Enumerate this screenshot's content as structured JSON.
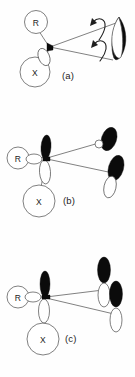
{
  "figure": {
    "background_color": "#ffffff",
    "ink_color": "#1a1a1a",
    "lobe_filled_color": "#0b0b0b",
    "lobe_empty_color": "#ffffff"
  },
  "panels": [
    {
      "id": "a",
      "label": "(a)",
      "substituents": [
        {
          "symbol": "R",
          "position": "upper-left"
        },
        {
          "symbol": "X",
          "position": "lower-left"
        }
      ],
      "orbital_count": 1,
      "orbital_style": "filled-leaf",
      "rotation_arrows": 2,
      "bond_lines": 2
    },
    {
      "id": "b",
      "label": "(b)",
      "substituents": [
        {
          "symbol": "R",
          "position": "left"
        },
        {
          "symbol": "X",
          "position": "lower-left"
        }
      ],
      "orbital_count": 3,
      "orbital_style": "tilted-p",
      "rotation_arrows": 0,
      "bond_lines": 2
    },
    {
      "id": "c",
      "label": "(c)",
      "substituents": [
        {
          "symbol": "R",
          "position": "left"
        },
        {
          "symbol": "X",
          "position": "lower-left"
        }
      ],
      "orbital_count": 3,
      "orbital_style": "vertical-p",
      "rotation_arrows": 0,
      "bond_lines": 2
    }
  ]
}
